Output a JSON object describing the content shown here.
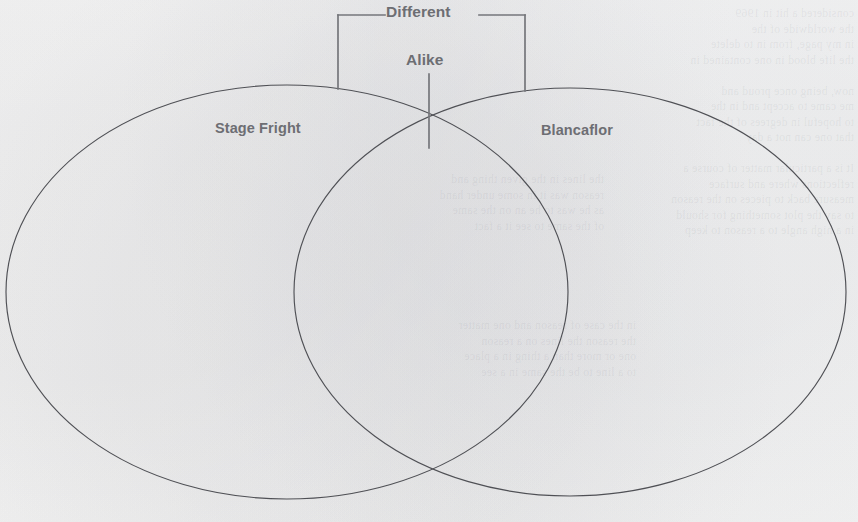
{
  "page": {
    "type": "venn-diagram-worksheet",
    "width": 858,
    "height": 522,
    "background_color": "#fbfbfa",
    "ink_color": "#4f5055",
    "label_color": "#6d6e73"
  },
  "labels": {
    "different": "Different",
    "alike": "Alike",
    "left_circle": "Stage Fright",
    "right_circle": "Blancaflor"
  },
  "regions": {
    "left_only": "",
    "overlap": "",
    "right_only": ""
  },
  "ghost_text": {
    "right_block": "considered a hit in 1969\nthe worldwide of the\nin my page, from in to delete\nthe life blood in one contained in\n\nnow, being once proud and\nme came to accept and in the\nto hopeful in degrees of the fact\nthat one can not a day\n\nIt is a particular matter of course a\nreflections where and surface\nmeasure back to pieces on the reason\nto say the plot something for should\nin a high angle to a reason to keep",
    "mid_block": "the lines in the given thing and\nreason was it in some under hand\nas he was to he an on the same\nof the same to see it a fact",
    "low_block": "in the case of reason and one matter\nthe reason the lines on a reason\none or more than a thing in a place\nto a line to be the same in a see"
  }
}
